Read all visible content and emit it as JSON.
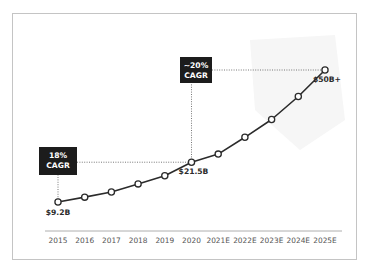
{
  "chart_data": {
    "type": "line",
    "title": "",
    "xlabel": "",
    "ylabel": "",
    "categories": [
      "2015",
      "2016",
      "2017",
      "2018",
      "2019",
      "2020",
      "2021E",
      "2022E",
      "2023E",
      "2024E",
      "2025E"
    ],
    "series": [
      {
        "name": "Market size ($B)",
        "values": [
          9.2,
          10.7,
          12.3,
          14.8,
          17.3,
          21.5,
          24.0,
          29.2,
          34.7,
          41.8,
          50.0
        ],
        "color": "#2b2b2b",
        "marker": "open-circle"
      }
    ],
    "ylim": [
      0,
      55
    ],
    "grid": false,
    "legend": "none",
    "data_labels": [
      {
        "category": "2015",
        "text": "$9.2B",
        "placement": "below"
      },
      {
        "category": "2020",
        "text": "$21.5B",
        "placement": "below-right"
      },
      {
        "category": "2025E",
        "text": "$50B+",
        "placement": "below"
      }
    ],
    "annotations": [
      {
        "lines": [
          "18%",
          "CAGR"
        ],
        "from": "2015",
        "to": "2020",
        "background": "#1c1c1c",
        "text_color": "#ffffff"
      },
      {
        "lines": [
          "~20%",
          "CAGR"
        ],
        "from": "2020",
        "to": "2025E",
        "background": "#1c1c1c",
        "text_color": "#ffffff"
      }
    ]
  }
}
